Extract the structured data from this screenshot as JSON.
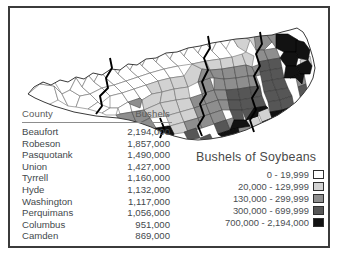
{
  "table": {
    "headers": [
      "County",
      "Bushels"
    ],
    "rows": [
      {
        "county": "Beaufort",
        "bushels": "2,194,000"
      },
      {
        "county": "Robeson",
        "bushels": "1,857,000"
      },
      {
        "county": "Pasquotank",
        "bushels": "1,490,000"
      },
      {
        "county": "Union",
        "bushels": "1,427,000"
      },
      {
        "county": "Tyrrell",
        "bushels": "1,160,000"
      },
      {
        "county": "Hyde",
        "bushels": "1,132,000"
      },
      {
        "county": "Washington",
        "bushels": "1,117,000"
      },
      {
        "county": "Perquimans",
        "bushels": "1,056,000"
      },
      {
        "county": "Columbus",
        "bushels": "951,000"
      },
      {
        "county": "Camden",
        "bushels": "869,000"
      }
    ]
  },
  "legend": {
    "title": "Bushels of Soybeans",
    "entries": [
      {
        "label": "0 - 19,999",
        "color": "#ffffff"
      },
      {
        "label": "20,000 - 129,999",
        "color": "#d2d2d2"
      },
      {
        "label": "130,000 - 299,999",
        "color": "#8e8e8e"
      },
      {
        "label": "300,000 - 699,999",
        "color": "#565656"
      },
      {
        "label": "700,000 - 2,194,000",
        "color": "#121212"
      }
    ]
  },
  "chart_data": {
    "type": "map",
    "title": "Bushels of Soybeans",
    "region": "North Carolina",
    "unit": "bushels",
    "classification": "graduated-choropleth",
    "class_breaks": [
      {
        "min": 0,
        "max": 19999,
        "label": "0 - 19,999",
        "color": "#ffffff"
      },
      {
        "min": 20000,
        "max": 129999,
        "label": "20,000 - 129,999",
        "color": "#d2d2d2"
      },
      {
        "min": 130000,
        "max": 299999,
        "label": "130,000 - 299,999",
        "color": "#8e8e8e"
      },
      {
        "min": 300000,
        "max": 699999,
        "label": "300,000 - 699,999",
        "color": "#565656"
      },
      {
        "min": 700000,
        "max": 2194000,
        "label": "700,000 - 2,194,000",
        "color": "#121212"
      }
    ],
    "top_counties": [
      {
        "county": "Beaufort",
        "value": 2194000
      },
      {
        "county": "Robeson",
        "value": 1857000
      },
      {
        "county": "Pasquotank",
        "value": 1490000
      },
      {
        "county": "Union",
        "value": 1427000
      },
      {
        "county": "Tyrrell",
        "value": 1160000
      },
      {
        "county": "Hyde",
        "value": 1132000
      },
      {
        "county": "Washington",
        "value": 1117000
      },
      {
        "county": "Perquimans",
        "value": 1056000
      },
      {
        "county": "Columbus",
        "value": 951000
      },
      {
        "county": "Camden",
        "value": 869000
      }
    ],
    "xlabel": "",
    "ylabel": "",
    "grid": false,
    "legend_position": "bottom-right"
  }
}
